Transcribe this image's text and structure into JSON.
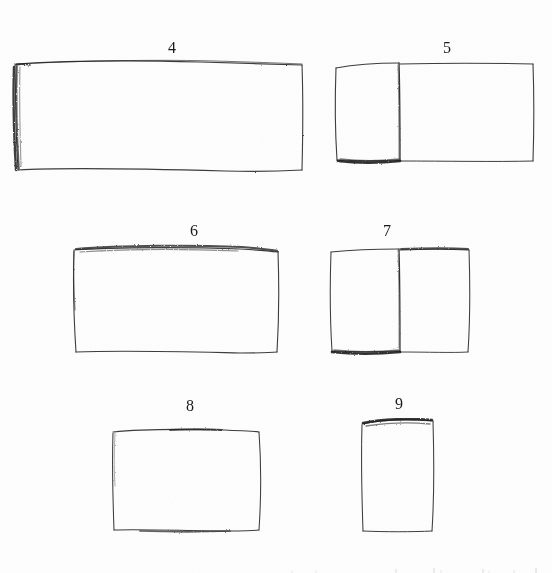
{
  "page": {
    "background_color": "#fefefe",
    "ink_color": "#2b2b2b",
    "width": 552,
    "height": 573,
    "medium": "pencil sketch on paper"
  },
  "figures": [
    {
      "id": "figure-4",
      "label": "4",
      "label_x": 168,
      "label_y": 40,
      "shape": "rectangle",
      "panels": 1,
      "orientation": "landscape",
      "spine_side": "left",
      "spine_shading": "heavy",
      "bbox": {
        "x": 14,
        "y": 62,
        "width": 289,
        "height": 110
      }
    },
    {
      "id": "figure-5",
      "label": "5",
      "label_x": 443,
      "label_y": 40,
      "shape": "rectangle",
      "panels": 2,
      "orientation": "landscape",
      "spine_side": "center",
      "spine_shading": "bottom-left-heavy",
      "bbox": {
        "x": 335,
        "y": 63,
        "width": 198,
        "height": 99
      },
      "fold_x": 400
    },
    {
      "id": "figure-6",
      "label": "6",
      "label_x": 190,
      "label_y": 223,
      "shape": "rectangle",
      "panels": 1,
      "orientation": "landscape",
      "spine_side": "top",
      "spine_shading": "top-heavy",
      "bbox": {
        "x": 73,
        "y": 248,
        "width": 205,
        "height": 105
      }
    },
    {
      "id": "figure-7",
      "label": "7",
      "label_x": 383,
      "label_y": 223,
      "shape": "rectangle",
      "panels": 2,
      "orientation": "landscape",
      "spine_side": "center",
      "spine_shading": "bottom-left-heavy",
      "bbox": {
        "x": 330,
        "y": 249,
        "width": 140,
        "height": 104
      },
      "fold_x": 400
    },
    {
      "id": "figure-8",
      "label": "8",
      "label_x": 186,
      "label_y": 398,
      "shape": "rectangle",
      "panels": 1,
      "orientation": "landscape",
      "spine_side": "top",
      "spine_shading": "light",
      "bbox": {
        "x": 112,
        "y": 430,
        "width": 148,
        "height": 101
      }
    },
    {
      "id": "figure-9",
      "label": "9",
      "label_x": 395,
      "label_y": 396,
      "shape": "rectangle",
      "panels": 1,
      "orientation": "portrait",
      "spine_side": "top",
      "spine_shading": "top-heavy",
      "bbox": {
        "x": 361,
        "y": 421,
        "width": 73,
        "height": 110
      }
    }
  ],
  "margin_marks": {
    "present": true,
    "note": "faint cut-off ascender strokes of handwriting along the bottom trim edge"
  }
}
